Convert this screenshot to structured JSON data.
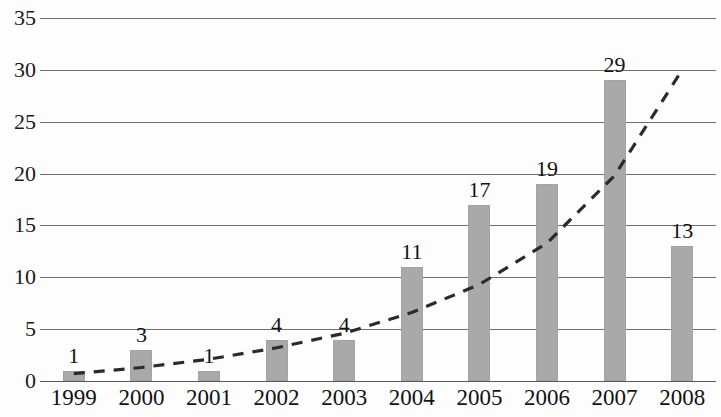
{
  "chart_data": {
    "type": "bar",
    "title": "",
    "subtitle": "",
    "xlabel": "",
    "ylabel": "",
    "categories": [
      "1999",
      "2000",
      "2001",
      "2002",
      "2003",
      "2004",
      "2005",
      "2006",
      "2007",
      "2008"
    ],
    "values": [
      1,
      3,
      1,
      4,
      4,
      11,
      17,
      19,
      29,
      13
    ],
    "data_labels": [
      "1",
      "3",
      "1",
      "4",
      "4",
      "11",
      "17",
      "19",
      "29",
      "13"
    ],
    "ylim": [
      0,
      35
    ],
    "ytick_labels": [
      "0",
      "5",
      "10",
      "15",
      "20",
      "25",
      "30",
      "35"
    ],
    "ytick_values": [
      0,
      5,
      10,
      15,
      20,
      25,
      30,
      35
    ],
    "grid": true,
    "grid_axis": "y",
    "legend": "none",
    "bar_color": "#a9a9a9",
    "grid_color": "#6e6e6e",
    "text_color": "#121212",
    "series": [
      {
        "name": "publications",
        "type": "bar",
        "values": [
          1,
          3,
          1,
          4,
          4,
          11,
          17,
          19,
          29,
          13
        ]
      },
      {
        "name": "trendline",
        "type": "line",
        "style": "dashed",
        "color": "#2b2b2b",
        "points": [
          {
            "x": "1999",
            "y": 0.7
          },
          {
            "x": "2000",
            "y": 1.3
          },
          {
            "x": "2001",
            "y": 2.1
          },
          {
            "x": "2002",
            "y": 3.2
          },
          {
            "x": "2003",
            "y": 4.6
          },
          {
            "x": "2004",
            "y": 6.6
          },
          {
            "x": "2005",
            "y": 9.3
          },
          {
            "x": "2006",
            "y": 13.3
          },
          {
            "x": "2007",
            "y": 19.8
          },
          {
            "x": "2008",
            "y": 30.0
          }
        ]
      }
    ]
  }
}
